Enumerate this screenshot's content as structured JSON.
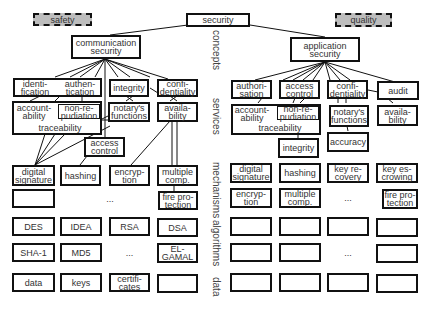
{
  "top": {
    "safety": "safety",
    "security": "security",
    "quality": "quality"
  },
  "concepts": {
    "communication": "communication\nsecurity",
    "application": "application\nsecurity"
  },
  "layers": {
    "concepts": "concepts",
    "services": "services",
    "mechanisms": "mechanisms",
    "algorithms": "algorithms",
    "data": "data"
  },
  "left": {
    "services_row1": [
      "identi-\nfication",
      "authen-\ntication",
      "integrity",
      "confi-\ndentiality"
    ],
    "accountability": "account-\nability",
    "non_repudiation": "non-re-\npudiation",
    "traceability": "traceability",
    "notarys": "notary's\nfunctions",
    "availability": "availa-\nbility",
    "access_control": "access\ncontrol",
    "mechanisms_row1": [
      "digital\nsignature",
      "hashing",
      "encryp-\ntion",
      "multiple\ncomp."
    ],
    "mechanisms_row2": [
      "",
      "...",
      "fire pro-\ntection"
    ],
    "algorithms_row1": [
      "DES",
      "IDEA",
      "RSA",
      "DSA"
    ],
    "algorithms_row2": [
      "SHA-1",
      "MD5",
      "...",
      "EL-\nGAMAL"
    ],
    "data_row": [
      "data",
      "keys",
      "certifi-\ncates",
      ""
    ]
  },
  "right": {
    "services_row1": [
      "authori-\nsation",
      "access\ncontrol",
      "confi-\ndentiality",
      "audit"
    ],
    "accountability": "account-\nability",
    "non_repudiation": "non-re-\npudiation",
    "traceability": "traceability",
    "notarys": "notary's\nfunctions",
    "availability": "availa-\nbility",
    "integrity": "integrity",
    "accuracy": "accuracy",
    "mechanisms_row1": [
      "digital\nsignature",
      "hashing",
      "key re-\ncovery",
      "key es-\ncrowing"
    ],
    "mechanisms_row2": [
      "encryp-\ntion",
      "multiple\ncomp.",
      "...",
      "fire pro-\ntection"
    ],
    "algorithms_row1": [
      "",
      "",
      "",
      ""
    ],
    "algorithms_row2": [
      "",
      "",
      "...",
      ""
    ],
    "data_row": [
      "",
      "",
      "",
      ""
    ]
  }
}
